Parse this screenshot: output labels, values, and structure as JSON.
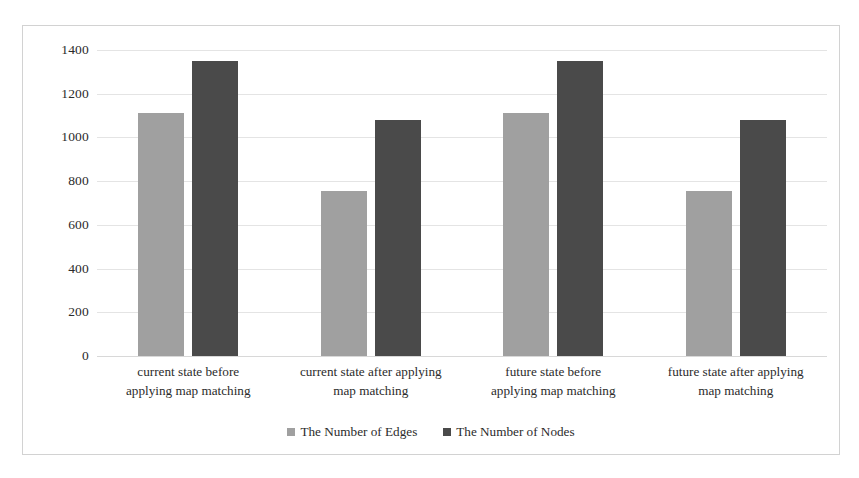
{
  "chart_data": {
    "type": "bar",
    "title": "",
    "xlabel": "",
    "ylabel": "",
    "ylim": [
      0,
      1400
    ],
    "yticks": [
      1400,
      1200,
      1000,
      800,
      600,
      400,
      200,
      0
    ],
    "grid": true,
    "legend_position": "bottom",
    "categories": [
      "current state before applying map matching",
      "current state after applying map matching",
      "future state before applying map matching",
      "future state after applying map matching"
    ],
    "series": [
      {
        "name": "The Number of Edges",
        "color": "#a0a0a0",
        "values": [
          1030,
          700,
          1030,
          700
        ]
      },
      {
        "name": "The Number of Nodes",
        "color": "#4a4a4a",
        "values": [
          1250,
          1000,
          1250,
          1000
        ]
      }
    ]
  },
  "axis": {
    "yticks": [
      "1400",
      "1200",
      "1000",
      "800",
      "600",
      "400",
      "200",
      "0"
    ],
    "categories": [
      {
        "line1": "current state before",
        "line2": "applying map matching"
      },
      {
        "line1": "current state after applying",
        "line2": "map matching"
      },
      {
        "line1": "future state before",
        "line2": "applying map matching"
      },
      {
        "line1": "future state after applying",
        "line2": "map matching"
      }
    ]
  },
  "legend": {
    "items": [
      {
        "label": "The Number of Edges",
        "color": "#a0a0a0",
        "swatch": "square-marker-icon"
      },
      {
        "label": "The Number of Nodes",
        "color": "#4a4a4a",
        "swatch": "square-marker-icon"
      }
    ]
  }
}
